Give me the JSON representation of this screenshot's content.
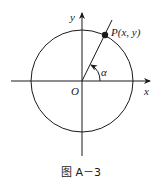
{
  "diagram": {
    "labels": {
      "y_axis": "y",
      "x_axis": "x",
      "origin": "O",
      "point": "P(x, y)",
      "angle": "α"
    },
    "caption": "图 A－3",
    "colors": {
      "stroke": "#1a1a1a",
      "background": "#ffffff"
    }
  }
}
